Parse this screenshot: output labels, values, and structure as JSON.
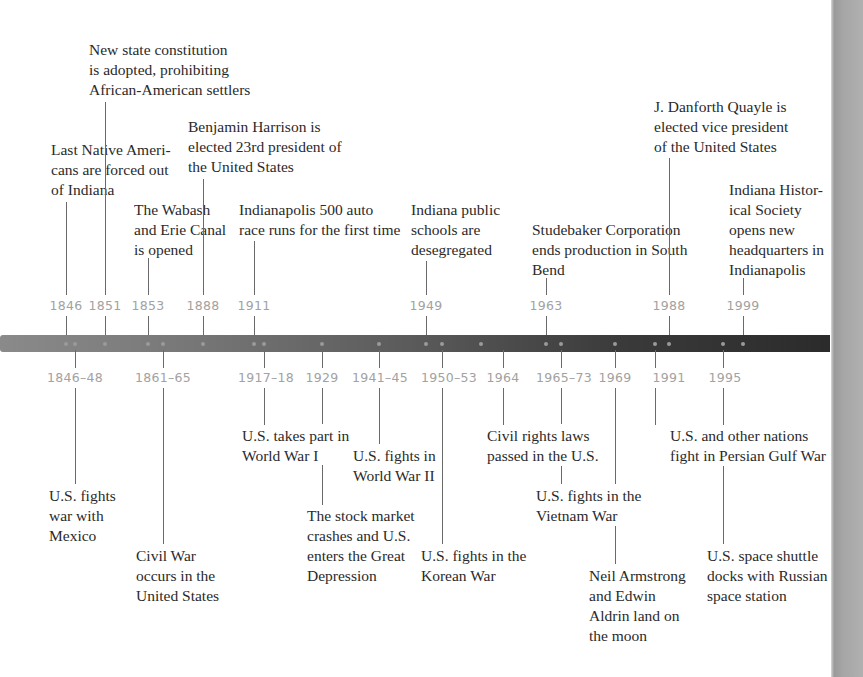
{
  "colors": {
    "bar_left": "#8a8a8a",
    "bar_right": "#2b2b2b",
    "year_label": "#a2a2a2",
    "text": "#2a2a2a",
    "connector": "#6a6a6a",
    "side_strip": "#a6a6a6"
  },
  "top_events": [
    {
      "year": "1846",
      "text": "Last Native Ameri-\ncans are forced out\nof Indiana"
    },
    {
      "year": "1851",
      "text": "New state constitution\nis adopted, prohibiting\nAfrican-American settlers"
    },
    {
      "year": "1853",
      "text": "The Wabash\nand Erie Canal\nis opened"
    },
    {
      "year": "1888",
      "text": "Benjamin Harrison is\nelected 23rd president of\nthe United States"
    },
    {
      "year": "1911",
      "text": "Indianapolis 500 auto\nrace runs for the first time"
    },
    {
      "year": "1949",
      "text": "Indiana public\nschools are\ndesegregated"
    },
    {
      "year": "1963",
      "text": "Studebaker Corporation\nends production in South\nBend"
    },
    {
      "year": "1988",
      "text": "J. Danforth Quayle is\nelected vice president\nof the United States"
    },
    {
      "year": "1999",
      "text": "Indiana Histor-\nical Society\nopens new\nheadquarters in\nIndianapolis"
    }
  ],
  "bottom_events": [
    {
      "year": "1846–48",
      "text": "U.S. fights\nwar with\nMexico"
    },
    {
      "year": "1861–65",
      "text": "Civil War\noccurs in the\nUnited States"
    },
    {
      "year": "1917–18",
      "text": "U.S. takes part in\nWorld War I"
    },
    {
      "year": "1929",
      "text": "The stock market\ncrashes and U.S.\nenters the Great\nDepression"
    },
    {
      "year": "1941–45",
      "text": "U.S. fights in\nWorld War II"
    },
    {
      "year": "1950–53",
      "text": "U.S. fights in the\nKorean War"
    },
    {
      "year": "1964",
      "text": "Civil rights laws\npassed in the U.S."
    },
    {
      "year": "1965–73",
      "text": "U.S. fights in the\nVietnam War"
    },
    {
      "year": "1969",
      "text": "Neil Armstrong\nand Edwin\nAldrin land on\nthe moon"
    },
    {
      "year": "1991",
      "text": "U.S. and other nations\nfight in Persian Gulf War"
    },
    {
      "year": "1995",
      "text": "U.S. space shuttle\ndocks with Russian\nspace station"
    }
  ]
}
